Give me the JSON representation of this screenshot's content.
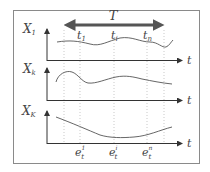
{
  "diagram": {
    "period_label": "T",
    "time_axis_label": "t",
    "colors": {
      "frame": "#8a8a8a",
      "axis": "#333333",
      "curve": "#555555",
      "period_arrow": "#555555",
      "grid_dots": "#bbbbbb",
      "text": "#444444"
    },
    "panels": [
      {
        "id": "x1",
        "var": "X",
        "sub": "1"
      },
      {
        "id": "xk",
        "var": "X",
        "sub": "k"
      },
      {
        "id": "xK",
        "var": "X",
        "sub": "K"
      }
    ],
    "time_points": [
      {
        "base": "t",
        "sub": "1"
      },
      {
        "base": "t",
        "sub": "i"
      },
      {
        "base": "t",
        "sub": "n"
      }
    ],
    "events": [
      {
        "base": "e",
        "sub": "t",
        "sup": "1"
      },
      {
        "base": "e",
        "sub": "t",
        "sup": "i"
      },
      {
        "base": "e",
        "sub": "t",
        "sup": "n"
      }
    ]
  }
}
